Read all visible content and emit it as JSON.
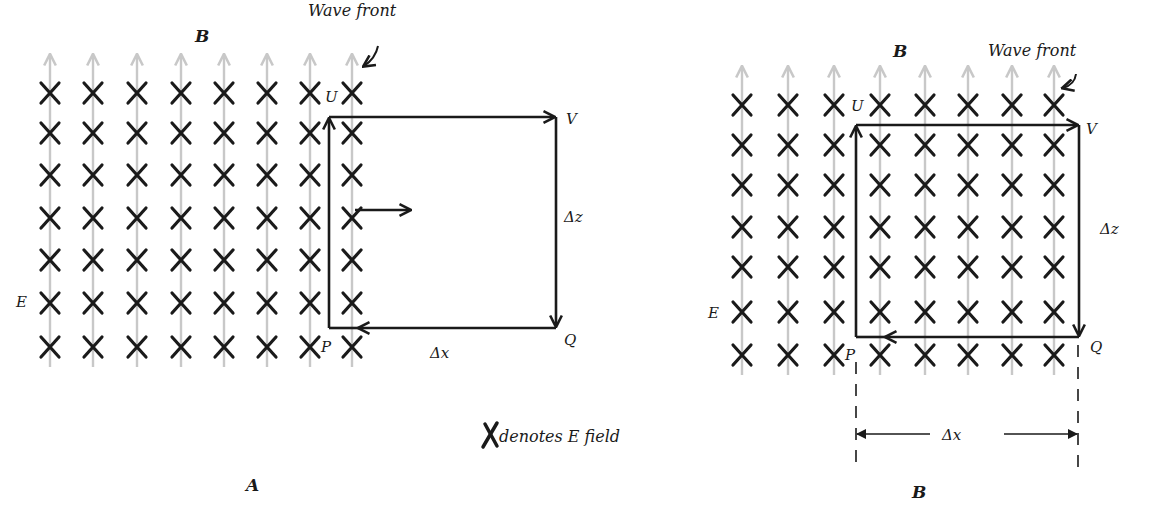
{
  "labels": {
    "legend_text": "denotes E field",
    "panel_a_caption": "A",
    "panel_b_caption": "B"
  },
  "panel_a": {
    "b_label": "B",
    "wavefront_label": "Wave front",
    "e_label": "E",
    "corners": {
      "U": "U",
      "V": "V",
      "P": "P",
      "Q": "Q"
    },
    "dz_label": "Δz",
    "dx_label": "Δx",
    "columns_x": [
      50,
      93,
      137,
      181,
      224,
      267,
      310,
      352
    ],
    "rows_y": [
      93,
      133,
      175,
      218,
      260,
      303,
      347
    ],
    "rect": {
      "left": 329,
      "top": 117,
      "right": 556,
      "bottom": 328
    },
    "propagation_arrow": {
      "x1": 355,
      "x2": 410,
      "y": 210
    }
  },
  "panel_b": {
    "b_label": "B",
    "wavefront_label": "Wave front",
    "e_label": "E",
    "corners": {
      "U": "U",
      "V": "V",
      "P": "P",
      "Q": "Q"
    },
    "dz_label": "Δz",
    "dx_label": "Δx",
    "columns_x": [
      742,
      788,
      834,
      880,
      925,
      968,
      1012,
      1054
    ],
    "rows_y": [
      105,
      145,
      185,
      227,
      267,
      312,
      355
    ],
    "rect": {
      "left": 856,
      "top": 125,
      "right": 1079,
      "bottom": 337
    }
  },
  "colors": {
    "ink": "#1a1a1a",
    "b_field": "#c8c8c8",
    "background": "#ffffff"
  }
}
